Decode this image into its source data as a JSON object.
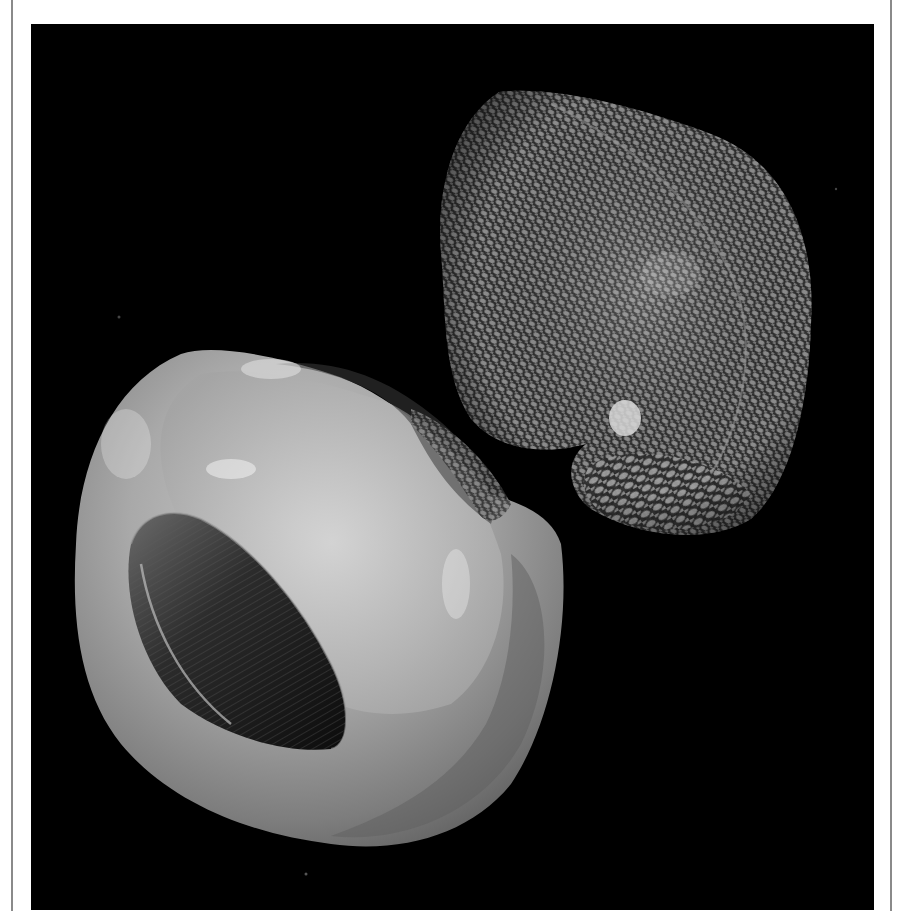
{
  "image": {
    "subject": "Two snail shells on black background",
    "alt": "Grayscale photograph of two shells: left shell viewed from aperture side showing smooth glossy interior, right shell showing densely scaled textured exterior",
    "background_color": "#000000",
    "frame_color": "#8a8a8a",
    "tone": "grayscale"
  }
}
